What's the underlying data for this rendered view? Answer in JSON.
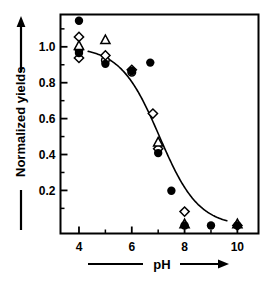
{
  "chart_data": {
    "type": "scatter",
    "title": "",
    "xlabel": "pH",
    "ylabel": "Normalized yields",
    "xlim": [
      3.3,
      10.8
    ],
    "ylim": [
      -0.04,
      1.18
    ],
    "grid": false,
    "legend": null,
    "x_ticks_major": [
      4,
      6,
      8,
      10
    ],
    "x_ticks_major_labels": [
      "4",
      "6",
      "8",
      "10"
    ],
    "x_ticks_minor": [
      5,
      7,
      9
    ],
    "y_ticks_major": [
      0.2,
      0.4,
      0.6,
      0.8,
      1.0
    ],
    "y_ticks_major_labels": [
      "0.2",
      "0.4",
      "0.6",
      "0.8",
      "1.0"
    ],
    "y_ticks_minor": [
      0.1,
      0.3,
      0.5,
      0.7,
      0.9,
      1.1
    ],
    "series": [
      {
        "name": "filled-circle",
        "marker": "filled-circle",
        "points": [
          {
            "x": 4.0,
            "y": 1.145
          },
          {
            "x": 4.0,
            "y": 0.965
          },
          {
            "x": 5.0,
            "y": 0.905
          },
          {
            "x": 6.0,
            "y": 0.865
          },
          {
            "x": 6.7,
            "y": 0.912
          },
          {
            "x": 7.0,
            "y": 0.408
          },
          {
            "x": 7.5,
            "y": 0.198
          },
          {
            "x": 8.0,
            "y": 0.005
          },
          {
            "x": 9.0,
            "y": 0.005
          },
          {
            "x": 10.0,
            "y": 0.005
          }
        ]
      },
      {
        "name": "open-diamond",
        "marker": "open-diamond",
        "points": [
          {
            "x": 4.0,
            "y": 1.055
          },
          {
            "x": 4.0,
            "y": 0.938
          },
          {
            "x": 5.0,
            "y": 0.952
          },
          {
            "x": 6.0,
            "y": 0.872
          },
          {
            "x": 6.8,
            "y": 0.628
          },
          {
            "x": 7.0,
            "y": 0.432
          },
          {
            "x": 8.0,
            "y": 0.082
          },
          {
            "x": 10.0,
            "y": 0.005
          }
        ]
      },
      {
        "name": "open-triangle",
        "marker": "open-triangle",
        "points": [
          {
            "x": 4.0,
            "y": 1.005
          },
          {
            "x": 5.0,
            "y": 1.038
          },
          {
            "x": 7.0,
            "y": 0.468
          },
          {
            "x": 8.0,
            "y": 0.012
          },
          {
            "x": 10.0,
            "y": 0.012
          }
        ]
      },
      {
        "name": "open-circle",
        "marker": "open-circle",
        "points": [
          {
            "x": 4.0,
            "y": 0.985
          },
          {
            "x": 5.0,
            "y": 0.925
          },
          {
            "x": 6.0,
            "y": 0.858
          }
        ]
      }
    ],
    "fit_curve": {
      "name": "sigmoid-fit",
      "description": "sigmoidal titration curve",
      "top": 1.0,
      "bottom": 0.0,
      "midpoint_x": 7.05,
      "slope": 1.35,
      "x_start": 4.35,
      "x_end": 9.6
    }
  },
  "axes": {
    "y_arrow_label": "Normalized yields",
    "x_arrow_label": "pH"
  },
  "colors": {
    "foreground": "#000000",
    "background": "#ffffff",
    "marker_fill": "#000000",
    "marker_open": "#ffffff"
  }
}
